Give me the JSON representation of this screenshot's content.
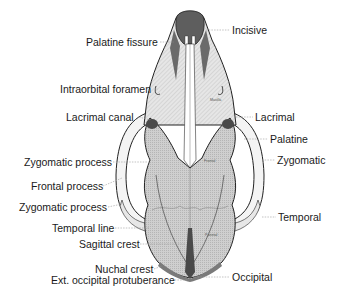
{
  "figure": {
    "labels_left": [
      {
        "id": "palatine-fissure",
        "text": "Palatine fissure"
      },
      {
        "id": "intraorbital-foramen",
        "text": "Intraorbital foramen"
      },
      {
        "id": "lacrimal-canal",
        "text": "Lacrimal canal"
      },
      {
        "id": "zygomatic-process-1",
        "text": "Zygomatic process"
      },
      {
        "id": "frontal-process",
        "text": "Frontal process"
      },
      {
        "id": "zygomatic-process-2",
        "text": "Zygomatic process"
      },
      {
        "id": "temporal-line",
        "text": "Temporal line"
      },
      {
        "id": "sagittal-crest",
        "text": "Sagittal crest"
      },
      {
        "id": "nuchal-crest",
        "text": "Nuchal crest"
      },
      {
        "id": "ext-occipital-protuberance",
        "text": "Ext. occipital protuberance"
      }
    ],
    "labels_right": [
      {
        "id": "incisive",
        "text": "Incisive"
      },
      {
        "id": "lacrimal",
        "text": "Lacrimal"
      },
      {
        "id": "palatine",
        "text": "Palatine"
      },
      {
        "id": "zygomatic",
        "text": "Zygomatic"
      },
      {
        "id": "temporal",
        "text": "Temporal"
      },
      {
        "id": "occipital",
        "text": "Occipital"
      }
    ],
    "bone_labels": {
      "maxilla": "Maxilla",
      "frontal": "Frontal",
      "parietal": "Parietal",
      "nasal": "Nasal"
    },
    "colors": {
      "outline": "#222222",
      "bone_light": "#dcdcdc",
      "bone_mid": "#c4c4c4",
      "bone_dark": "#5a5a5a",
      "leader": "#9a9a9a",
      "text": "#1a1a1a"
    }
  }
}
